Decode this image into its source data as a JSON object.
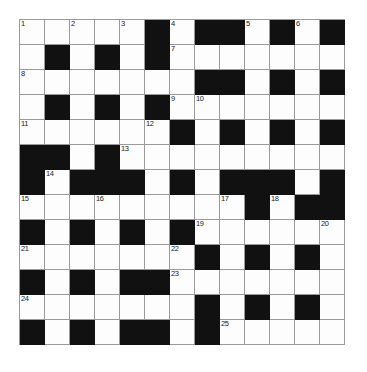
{
  "puzzle": {
    "title": "Crossword Grid",
    "columns": 13,
    "rows": 13,
    "cell_size_px": 25,
    "colors": {
      "block": "#111111",
      "open": "#fdfdfd",
      "gridline": "#9a9a9a",
      "number_text": "#1a1a1a",
      "page_background": "#ffffff"
    },
    "clue_numbers_visible": [
      1,
      2,
      3,
      4,
      5,
      6,
      7,
      8,
      9,
      10,
      11,
      12,
      13,
      14,
      15,
      16,
      17,
      18,
      19,
      20,
      21,
      22,
      23,
      24,
      25
    ],
    "numbered_cells": [
      {
        "number": 1,
        "row": 1,
        "col": 1
      },
      {
        "number": 2,
        "row": 1,
        "col": 3
      },
      {
        "number": 3,
        "row": 1,
        "col": 5
      },
      {
        "number": 4,
        "row": 1,
        "col": 7
      },
      {
        "number": 5,
        "row": 1,
        "col": 10
      },
      {
        "number": 6,
        "row": 1,
        "col": 12
      },
      {
        "number": 7,
        "row": 2,
        "col": 7
      },
      {
        "number": 8,
        "row": 3,
        "col": 1
      },
      {
        "number": 9,
        "row": 4,
        "col": 7
      },
      {
        "number": 10,
        "row": 4,
        "col": 8
      },
      {
        "number": 11,
        "row": 5,
        "col": 1
      },
      {
        "number": 12,
        "row": 5,
        "col": 6
      },
      {
        "number": 13,
        "row": 6,
        "col": 5
      },
      {
        "number": 14,
        "row": 7,
        "col": 2
      },
      {
        "number": 15,
        "row": 8,
        "col": 1
      },
      {
        "number": 16,
        "row": 8,
        "col": 4
      },
      {
        "number": 17,
        "row": 8,
        "col": 9
      },
      {
        "number": 18,
        "row": 8,
        "col": 11
      },
      {
        "number": 19,
        "row": 9,
        "col": 8
      },
      {
        "number": 20,
        "row": 9,
        "col": 13
      },
      {
        "number": 21,
        "row": 10,
        "col": 1
      },
      {
        "number": 22,
        "row": 10,
        "col": 7
      },
      {
        "number": 23,
        "row": 11,
        "col": 7
      },
      {
        "number": 24,
        "row": 12,
        "col": 1
      },
      {
        "number": 25,
        "row": 13,
        "col": 9
      }
    ],
    "legend": {
      "open": "open / fillable square",
      "block": "blocked square"
    },
    "rows_data": [
      {
        "row": 1,
        "cells": [
          "open",
          "open",
          "open",
          "open",
          "open",
          "block",
          "open",
          "block",
          "block",
          "open",
          "block",
          "open",
          "block"
        ]
      },
      {
        "row": 2,
        "cells": [
          "open",
          "block",
          "open",
          "block",
          "open",
          "block",
          "open",
          "open",
          "open",
          "open",
          "open",
          "open",
          "open"
        ]
      },
      {
        "row": 3,
        "cells": [
          "open",
          "open",
          "open",
          "open",
          "open",
          "open",
          "open",
          "block",
          "block",
          "open",
          "block",
          "open",
          "block"
        ]
      },
      {
        "row": 4,
        "cells": [
          "open",
          "block",
          "open",
          "block",
          "open",
          "block",
          "open",
          "open",
          "open",
          "open",
          "open",
          "open",
          "open"
        ]
      },
      {
        "row": 5,
        "cells": [
          "open",
          "open",
          "open",
          "open",
          "open",
          "open",
          "block",
          "open",
          "block",
          "open",
          "block",
          "open",
          "block"
        ]
      },
      {
        "row": 6,
        "cells": [
          "block",
          "block",
          "open",
          "block",
          "open",
          "open",
          "open",
          "open",
          "open",
          "open",
          "open",
          "open",
          "open"
        ]
      },
      {
        "row": 7,
        "cells": [
          "block",
          "open",
          "block",
          "block",
          "block",
          "open",
          "block",
          "open",
          "block",
          "block",
          "block",
          "open",
          "block"
        ]
      },
      {
        "row": 8,
        "cells": [
          "open",
          "open",
          "open",
          "open",
          "open",
          "open",
          "open",
          "open",
          "open",
          "block",
          "open",
          "block",
          "block"
        ]
      },
      {
        "row": 9,
        "cells": [
          "block",
          "open",
          "block",
          "open",
          "block",
          "open",
          "block",
          "open",
          "open",
          "open",
          "open",
          "open",
          "open"
        ]
      },
      {
        "row": 10,
        "cells": [
          "open",
          "open",
          "open",
          "open",
          "open",
          "open",
          "open",
          "block",
          "open",
          "block",
          "open",
          "block",
          "open"
        ]
      },
      {
        "row": 11,
        "cells": [
          "block",
          "open",
          "block",
          "open",
          "block",
          "block",
          "open",
          "open",
          "open",
          "open",
          "open",
          "open",
          "open"
        ]
      },
      {
        "row": 12,
        "cells": [
          "open",
          "open",
          "open",
          "open",
          "open",
          "open",
          "open",
          "block",
          "open",
          "block",
          "open",
          "block",
          "open"
        ]
      },
      {
        "row": 13,
        "cells": [
          "block",
          "open",
          "block",
          "open",
          "block",
          "block",
          "open",
          "block",
          "open",
          "open",
          "open",
          "open",
          "open"
        ]
      }
    ]
  }
}
